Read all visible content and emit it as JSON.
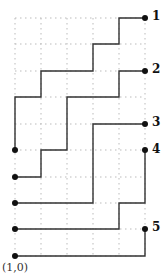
{
  "diagram": {
    "type": "lattice-paths",
    "grid": {
      "columns_x": [
        15,
        41,
        67,
        93,
        119,
        145
      ],
      "rows_y": [
        18,
        44,
        71,
        97,
        124,
        150,
        177,
        203,
        229,
        256
      ],
      "style": "dotted",
      "color": "#bbbbbb"
    },
    "path_color": "#333333",
    "dot_color": "#111111",
    "origin_label": "(1,0)",
    "paths": [
      {
        "label": "1",
        "points": [
          [
            145,
            18
          ],
          [
            119,
            18
          ],
          [
            119,
            44
          ],
          [
            93,
            44
          ],
          [
            93,
            71
          ],
          [
            41,
            71
          ],
          [
            41,
            97
          ],
          [
            15,
            97
          ],
          [
            15,
            150
          ]
        ],
        "end_dots": [
          [
            145,
            18
          ],
          [
            15,
            150
          ]
        ]
      },
      {
        "label": "2",
        "points": [
          [
            145,
            71
          ],
          [
            119,
            71
          ],
          [
            119,
            97
          ],
          [
            67,
            97
          ],
          [
            67,
            150
          ],
          [
            41,
            150
          ],
          [
            41,
            177
          ],
          [
            15,
            177
          ]
        ],
        "end_dots": [
          [
            145,
            71
          ],
          [
            15,
            177
          ]
        ]
      },
      {
        "label": "3",
        "points": [
          [
            145,
            124
          ],
          [
            93,
            124
          ],
          [
            93,
            203
          ],
          [
            15,
            203
          ]
        ],
        "end_dots": [
          [
            145,
            124
          ],
          [
            15,
            203
          ]
        ]
      },
      {
        "label": "4",
        "points": [
          [
            145,
            150
          ],
          [
            145,
            203
          ],
          [
            119,
            203
          ],
          [
            119,
            229
          ],
          [
            15,
            229
          ]
        ],
        "end_dots": [
          [
            145,
            150
          ],
          [
            15,
            229
          ]
        ]
      },
      {
        "label": "5",
        "points": [
          [
            145,
            229
          ],
          [
            145,
            256
          ],
          [
            15,
            256
          ]
        ],
        "end_dots": [
          [
            145,
            229
          ],
          [
            15,
            256
          ]
        ]
      }
    ],
    "labels": [
      {
        "text": "1",
        "x": 152,
        "y": 10
      },
      {
        "text": "2",
        "x": 152,
        "y": 63
      },
      {
        "text": "3",
        "x": 152,
        "y": 116
      },
      {
        "text": "4",
        "x": 152,
        "y": 143
      },
      {
        "text": "5",
        "x": 152,
        "y": 221
      }
    ]
  }
}
